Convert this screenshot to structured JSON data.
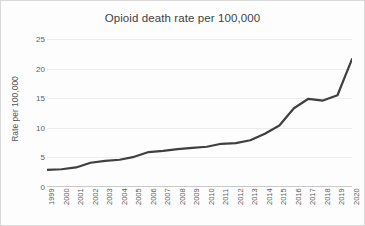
{
  "chart_data": {
    "type": "line",
    "title": "Opioid death rate per 100,000",
    "xlabel": "",
    "ylabel": "Rate per 100,000",
    "ylim": [
      0,
      25
    ],
    "yticks": [
      0,
      5,
      10,
      15,
      20,
      25
    ],
    "grid": true,
    "legend": "none",
    "line_color": "#3f3f3f",
    "categories": [
      "1999",
      "2000",
      "2001",
      "2002",
      "2003",
      "2004",
      "2005",
      "2006",
      "2007",
      "2008",
      "2009",
      "2010",
      "2011",
      "2012",
      "2013",
      "2014",
      "2015",
      "2016",
      "2017",
      "2018",
      "2019",
      "2020"
    ],
    "values": [
      2.9,
      3.0,
      3.3,
      4.1,
      4.4,
      4.6,
      5.1,
      5.9,
      6.1,
      6.4,
      6.6,
      6.8,
      7.3,
      7.4,
      7.9,
      9.0,
      10.4,
      13.3,
      14.9,
      14.6,
      15.5,
      21.6
    ]
  },
  "chart": {
    "title": "Opioid death rate per 100,000",
    "ylabel": "Rate per 100,000"
  }
}
